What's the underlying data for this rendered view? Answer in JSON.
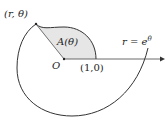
{
  "diagram": {
    "point_label": "(r, θ)",
    "area_label": "A(θ)",
    "origin_label": "O",
    "unit_point_label": "(1,0)",
    "curve_label": "r = e",
    "curve_exponent": "θ",
    "colors": {
      "stroke": "#333333",
      "shade": "#e6e6e6",
      "text": "#222222"
    }
  }
}
